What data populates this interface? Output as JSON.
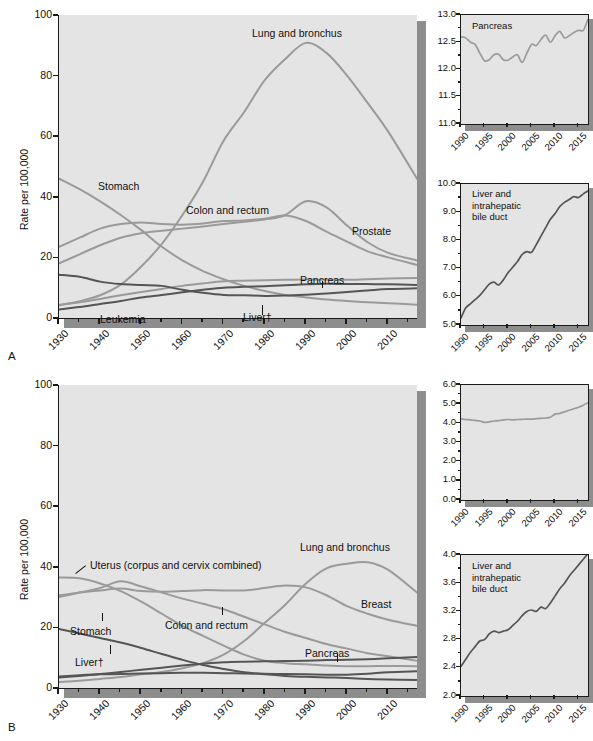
{
  "figure": {
    "panels": [
      {
        "letter": "A",
        "group": "Males"
      },
      {
        "letter": "B",
        "group": "Females"
      }
    ],
    "y_axis_label": "Rate per 100,000",
    "dagger": "†"
  },
  "chart_data": [
    {
      "id": "panel-a-main",
      "type": "line",
      "title": "",
      "xlabel": "",
      "ylabel": "Rate per 100,000",
      "xlim": [
        1930,
        2017
      ],
      "ylim": [
        0,
        100
      ],
      "xticks": [
        1930,
        1940,
        1950,
        1960,
        1970,
        1980,
        1990,
        2000,
        2010
      ],
      "yticks": [
        0,
        20,
        40,
        60,
        80,
        100
      ],
      "grid": false,
      "legend": "inline-annotations",
      "x": [
        1930,
        1935,
        1940,
        1945,
        1950,
        1955,
        1960,
        1965,
        1970,
        1975,
        1980,
        1985,
        1990,
        1995,
        2000,
        2005,
        2010,
        2017
      ],
      "series": [
        {
          "name": "Lung and bronchus",
          "color": "#9a9a9a",
          "values": [
            4.2,
            5.5,
            7.5,
            11.0,
            17.0,
            24.5,
            34.0,
            45.0,
            58.5,
            68.0,
            78.5,
            85.5,
            90.8,
            87.5,
            80.0,
            71.0,
            61.5,
            46.0
          ]
        },
        {
          "name": "Stomach",
          "color": "#9a9a9a",
          "values": [
            46.0,
            42.5,
            38.5,
            34.0,
            29.0,
            23.5,
            19.0,
            15.5,
            12.8,
            10.6,
            8.9,
            7.6,
            6.8,
            6.1,
            5.6,
            5.2,
            4.9,
            4.4
          ]
        },
        {
          "name": "Colon and rectum",
          "color": "#9a9a9a",
          "values": [
            23.5,
            26.5,
            29.5,
            31.0,
            31.5,
            31.0,
            30.8,
            31.2,
            32.0,
            32.2,
            32.8,
            33.8,
            32.0,
            28.5,
            25.2,
            22.0,
            20.0,
            17.5
          ]
        },
        {
          "name": "Prostate",
          "color": "#9a9a9a",
          "values": [
            18.0,
            21.0,
            24.0,
            26.5,
            28.0,
            28.8,
            29.5,
            30.2,
            31.0,
            31.8,
            32.5,
            34.0,
            38.5,
            36.5,
            30.5,
            25.0,
            21.5,
            19.0
          ]
        },
        {
          "name": "Pancreas",
          "color": "#9a9a9a",
          "values": [
            4.3,
            5.2,
            6.3,
            7.5,
            8.6,
            9.6,
            10.6,
            11.4,
            12.1,
            12.3,
            12.5,
            12.6,
            12.7,
            12.6,
            12.6,
            12.8,
            13.0,
            13.2
          ]
        },
        {
          "name": "Leukemia",
          "color": "#555555",
          "values": [
            2.8,
            3.6,
            4.6,
            5.6,
            6.8,
            7.6,
            8.5,
            9.3,
            10.0,
            10.3,
            10.5,
            10.8,
            11.1,
            11.3,
            11.2,
            11.2,
            11.1,
            10.9
          ]
        },
        {
          "name": "Liver and intrahepatic bile duct",
          "color": "#555555",
          "values": [
            14.3,
            13.6,
            12.0,
            11.2,
            10.9,
            10.6,
            9.3,
            8.3,
            7.6,
            7.5,
            7.3,
            7.4,
            7.7,
            8.1,
            8.6,
            9.1,
            9.6,
            9.8
          ]
        }
      ],
      "annotations": [
        {
          "text": "Lung and bronchus"
        },
        {
          "text": "Stomach"
        },
        {
          "text": "Colon and rectum"
        },
        {
          "text": "Prostate"
        },
        {
          "text": "Pancreas"
        },
        {
          "text": "Leukemia"
        },
        {
          "text": "Liver†"
        }
      ]
    },
    {
      "id": "panel-a-inset-pancreas",
      "type": "line",
      "title": "Pancreas",
      "xlim": [
        1990,
        2017
      ],
      "ylim": [
        11.0,
        13.0
      ],
      "xticks": [
        1990,
        1995,
        2000,
        2005,
        2010,
        2015
      ],
      "yticks": [
        "11.0",
        "11.5",
        "12.0",
        "12.5",
        "13.0"
      ],
      "x": [
        1990,
        1991,
        1992,
        1993,
        1994,
        1995,
        1996,
        1997,
        1998,
        1999,
        2000,
        2001,
        2002,
        2003,
        2004,
        2005,
        2006,
        2007,
        2008,
        2009,
        2010,
        2011,
        2012,
        2013,
        2014,
        2015,
        2016,
        2017
      ],
      "values": [
        12.6,
        12.58,
        12.5,
        12.46,
        12.3,
        12.16,
        12.18,
        12.27,
        12.28,
        12.18,
        12.17,
        12.23,
        12.27,
        12.13,
        12.3,
        12.46,
        12.44,
        12.55,
        12.63,
        12.5,
        12.62,
        12.7,
        12.58,
        12.62,
        12.68,
        12.72,
        12.72,
        12.92
      ]
    },
    {
      "id": "panel-a-inset-liver",
      "type": "line",
      "title": "Liver and intrahepatic bile duct",
      "xlim": [
        1990,
        2017
      ],
      "ylim": [
        5.0,
        10.0
      ],
      "xticks": [
        1990,
        1995,
        2000,
        2005,
        2010,
        2015
      ],
      "yticks": [
        "5.0",
        "6.0",
        "7.0",
        "8.0",
        "9.0",
        "10.0"
      ],
      "x": [
        1990,
        1991,
        1992,
        1993,
        1994,
        1995,
        1996,
        1997,
        1998,
        1999,
        2000,
        2001,
        2002,
        2003,
        2004,
        2005,
        2006,
        2007,
        2008,
        2009,
        2010,
        2011,
        2012,
        2013,
        2014,
        2015,
        2016,
        2017
      ],
      "values": [
        5.25,
        5.6,
        5.75,
        5.9,
        6.05,
        6.25,
        6.45,
        6.52,
        6.42,
        6.6,
        6.85,
        7.05,
        7.25,
        7.5,
        7.6,
        7.58,
        7.85,
        8.15,
        8.45,
        8.75,
        8.95,
        9.2,
        9.35,
        9.45,
        9.55,
        9.52,
        9.65,
        9.75
      ]
    },
    {
      "id": "panel-b-main",
      "type": "line",
      "title": "",
      "xlabel": "",
      "ylabel": "Rate per 100,000",
      "xlim": [
        1930,
        2017
      ],
      "ylim": [
        0,
        100
      ],
      "xticks": [
        1930,
        1940,
        1950,
        1960,
        1970,
        1980,
        1990,
        2000,
        2010
      ],
      "yticks": [
        0,
        20,
        40,
        60,
        80,
        100
      ],
      "grid": false,
      "legend": "inline-annotations",
      "x": [
        1930,
        1935,
        1940,
        1945,
        1950,
        1955,
        1960,
        1965,
        1970,
        1975,
        1980,
        1985,
        1990,
        1995,
        2000,
        2005,
        2010,
        2017
      ],
      "series": [
        {
          "name": "Uterus (corpus and cervix combined)",
          "color": "#9a9a9a",
          "values": [
            36.5,
            36.2,
            34.5,
            32.0,
            28.5,
            24.5,
            20.5,
            17.2,
            14.0,
            11.0,
            9.0,
            8.2,
            7.8,
            7.4,
            7.2,
            7.2,
            7.3,
            7.2
          ]
        },
        {
          "name": "Breast",
          "color": "#9a9a9a",
          "values": [
            30.5,
            31.5,
            32.2,
            32.8,
            32.0,
            31.8,
            32.0,
            32.3,
            32.2,
            32.2,
            33.0,
            33.8,
            33.2,
            30.6,
            27.0,
            24.5,
            22.5,
            20.5
          ]
        },
        {
          "name": "Colon and rectum",
          "color": "#9a9a9a",
          "values": [
            30.0,
            31.5,
            33.0,
            35.2,
            33.5,
            31.5,
            29.5,
            27.8,
            26.0,
            23.5,
            21.0,
            18.5,
            16.5,
            14.5,
            13.0,
            11.5,
            10.5,
            9.0
          ]
        },
        {
          "name": "Lung and bronchus",
          "color": "#9a9a9a",
          "values": [
            2.0,
            2.4,
            3.0,
            3.6,
            4.5,
            5.3,
            6.5,
            8.2,
            11.0,
            15.5,
            21.5,
            27.5,
            34.5,
            39.5,
            41.0,
            41.5,
            39.0,
            31.5
          ]
        },
        {
          "name": "Stomach",
          "color": "#555555",
          "values": [
            19.5,
            18.0,
            16.5,
            15.0,
            13.2,
            11.2,
            9.3,
            7.6,
            6.3,
            5.2,
            4.5,
            4.0,
            3.7,
            3.5,
            3.3,
            3.0,
            2.8,
            2.6
          ]
        },
        {
          "name": "Pancreas",
          "color": "#555555",
          "values": [
            3.5,
            4.0,
            4.6,
            5.3,
            6.0,
            6.7,
            7.4,
            8.0,
            8.5,
            8.7,
            8.8,
            8.9,
            9.0,
            9.2,
            9.3,
            9.5,
            9.8,
            10.2
          ]
        },
        {
          "name": "Liver and intrahepatic bile duct",
          "color": "#555555",
          "values": [
            3.8,
            4.2,
            4.5,
            4.6,
            4.8,
            4.9,
            5.0,
            5.0,
            4.9,
            4.8,
            4.7,
            4.6,
            4.5,
            4.4,
            4.4,
            4.7,
            5.2,
            5.5
          ]
        }
      ],
      "annotations": [
        {
          "text": "Uterus (corpus and cervix combined)"
        },
        {
          "text": "Lung and bronchus"
        },
        {
          "text": "Breast"
        },
        {
          "text": "Colon and rectum"
        },
        {
          "text": "Stomach"
        },
        {
          "text": "Pancreas"
        },
        {
          "text": "Liver†"
        }
      ]
    },
    {
      "id": "panel-b-inset-uterine",
      "type": "line",
      "title": "Uterine corpus",
      "xlim": [
        1990,
        2017
      ],
      "ylim": [
        0.0,
        6.0
      ],
      "xticks": [
        1990,
        1995,
        2000,
        2005,
        2010,
        2015
      ],
      "yticks": [
        "0.0",
        "1.0",
        "2.0",
        "3.0",
        "4.0",
        "5.0",
        "6.0"
      ],
      "x": [
        1990,
        1991,
        1992,
        1993,
        1994,
        1995,
        1996,
        1997,
        1998,
        1999,
        2000,
        2001,
        2002,
        2003,
        2004,
        2005,
        2006,
        2007,
        2008,
        2009,
        2010,
        2011,
        2012,
        2013,
        2014,
        2015,
        2016,
        2017
      ],
      "values": [
        4.24,
        4.2,
        4.18,
        4.15,
        4.12,
        4.05,
        4.08,
        4.12,
        4.14,
        4.18,
        4.2,
        4.18,
        4.2,
        4.21,
        4.22,
        4.22,
        4.24,
        4.26,
        4.28,
        4.32,
        4.48,
        4.52,
        4.6,
        4.68,
        4.76,
        4.84,
        4.94,
        5.08
      ]
    },
    {
      "id": "panel-b-inset-liver",
      "type": "line",
      "title": "Liver and intrahepatic bile duct",
      "xlim": [
        1990,
        2017
      ],
      "ylim": [
        2.0,
        4.0
      ],
      "xticks": [
        1990,
        1995,
        2000,
        2005,
        2010,
        2015
      ],
      "yticks": [
        "2.0",
        "2.4",
        "2.8",
        "3.2",
        "3.6",
        "4.0"
      ],
      "x": [
        1990,
        1991,
        1992,
        1993,
        1994,
        1995,
        1996,
        1997,
        1998,
        1999,
        2000,
        2001,
        2002,
        2003,
        2004,
        2005,
        2006,
        2007,
        2008,
        2009,
        2010,
        2011,
        2012,
        2013,
        2014,
        2015,
        2016,
        2017
      ],
      "values": [
        2.42,
        2.52,
        2.62,
        2.7,
        2.78,
        2.8,
        2.88,
        2.92,
        2.9,
        2.92,
        2.94,
        3.0,
        3.06,
        3.14,
        3.2,
        3.22,
        3.2,
        3.26,
        3.24,
        3.32,
        3.42,
        3.52,
        3.6,
        3.7,
        3.78,
        3.86,
        3.94,
        4.02
      ]
    }
  ]
}
